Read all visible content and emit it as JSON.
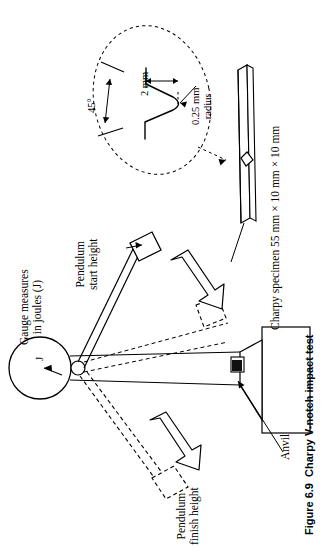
{
  "figure": {
    "caption_number": "Figure 6.9",
    "caption_title": "Charpy V-notch impact test",
    "orientation": "rotated-90-ccw",
    "background_color": "#ffffff",
    "ink_color": "#000000"
  },
  "labels": {
    "gauge": "Gauge measures\nin joules (J)",
    "gauge_dial_symbol": "J",
    "pendulum_start": "Pendulum\nstart height",
    "pendulum_finish": "Pendulum\nfinish height",
    "anvil": "Anvil",
    "specimen": "Charpy specimen 55 mm × 10 mm × 10 mm"
  },
  "notch_detail": {
    "width_dim": "2 mm",
    "radius_dim": "0.25 mm\nradius",
    "angle_dim": "45°"
  },
  "specimen_spec": {
    "length_mm": 55,
    "width_mm": 10,
    "height_mm": 10,
    "notch_angle_deg": 45,
    "notch_depth_mm": 2,
    "notch_root_radius_mm": 0.25,
    "energy_unit": "J"
  }
}
